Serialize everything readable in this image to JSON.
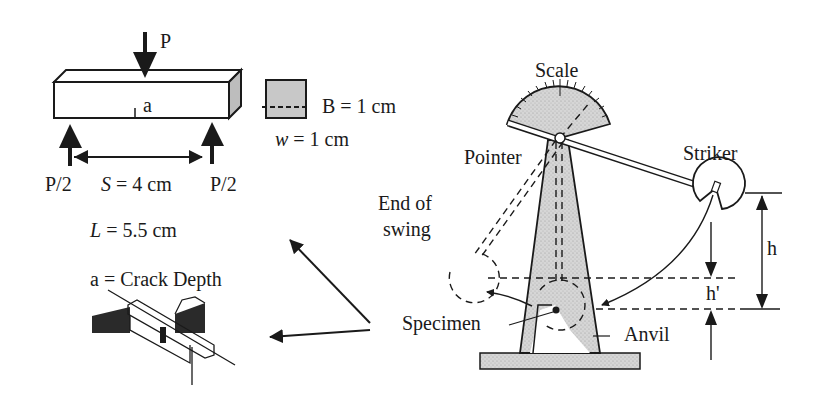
{
  "beam": {
    "load_label": "P",
    "crack_label": "a",
    "support_left_label": "P/2",
    "support_right_label": "P/2",
    "span_var": "S",
    "span_value": " = 4 cm",
    "length_var": "L",
    "length_value": " = 5.5 cm"
  },
  "cross_section": {
    "breadth_label": "B = 1 cm",
    "width_var": "w",
    "width_value": " = 1 cm"
  },
  "crack_detail": {
    "label": "a = Crack Depth"
  },
  "pendulum": {
    "scale_label": "Scale",
    "pointer_label": "Pointer",
    "striker_label": "Striker",
    "end_of_swing_line1": "End of",
    "end_of_swing_line2": "swing",
    "specimen_label": "Specimen",
    "anvil_label": "Anvil",
    "height_label": "h",
    "rebound_height_label": "h'"
  },
  "colors": {
    "ink": "#1a1a1a",
    "shade": "#c8c8c8",
    "background": "#ffffff"
  }
}
